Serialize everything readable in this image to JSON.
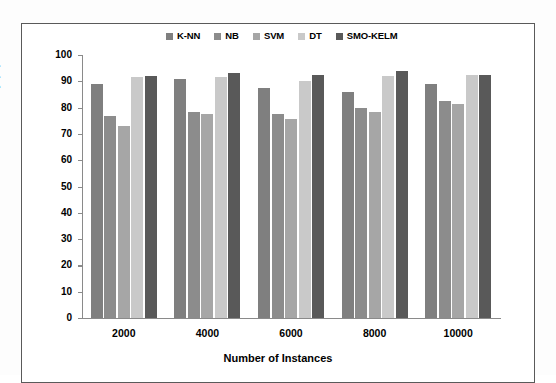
{
  "chart_data": {
    "type": "bar",
    "title": "",
    "xlabel": "Number of Instances",
    "ylabel": "Accurcay (%)",
    "categories": [
      "2000",
      "4000",
      "6000",
      "8000",
      "10000"
    ],
    "ylim": [
      0,
      100
    ],
    "yticks": [
      "100",
      "90",
      "80",
      "70",
      "60",
      "50",
      "40",
      "30",
      "20",
      "10",
      "0"
    ],
    "grid": false,
    "legend_position": "top-center",
    "series": [
      {
        "name": "K-NN",
        "color": "#7f7f7f",
        "values": [
          89.0,
          91.0,
          87.5,
          86.0,
          89.0
        ]
      },
      {
        "name": "NB",
        "color": "#8c8c8c",
        "values": [
          77.0,
          78.5,
          77.5,
          80.0,
          82.5
        ]
      },
      {
        "name": "SVM",
        "color": "#a6a6a6",
        "values": [
          73.0,
          77.5,
          75.5,
          78.5,
          81.5
        ]
      },
      {
        "name": "DT",
        "color": "#c9c9c9",
        "values": [
          91.5,
          91.5,
          90.0,
          92.0,
          92.5
        ]
      },
      {
        "name": "SMO-KELM",
        "color": "#595959",
        "values": [
          92.0,
          93.0,
          92.5,
          94.0,
          92.5
        ]
      }
    ]
  }
}
